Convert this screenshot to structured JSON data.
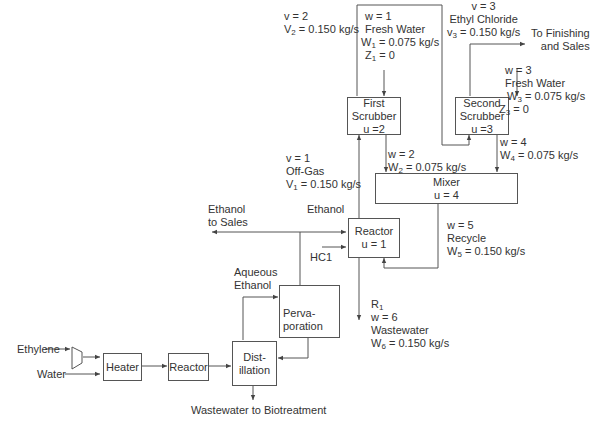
{
  "units": {
    "first_scrubber": {
      "l1": "First",
      "l2": "Scrubber",
      "l3": "u =2"
    },
    "second_scrubber": {
      "l1": "Second",
      "l2": "Scrubber",
      "l3": "u =3"
    },
    "mixer": {
      "l1": "Mixer",
      "l2": "u = 4"
    },
    "reactor1": {
      "l1": "Reactor",
      "l2": "u = 1"
    },
    "pervaporation": {
      "l1": "Perva-",
      "l2": "poration"
    },
    "distillation": {
      "l1": "Dist-",
      "l2": "illation"
    },
    "heater": {
      "l1": "Heater"
    },
    "reactor": {
      "l1": "Reactor"
    }
  },
  "streams": {
    "v2": {
      "id": "v = 2",
      "flow_sym": "V",
      "flow_sub": "2",
      "flow_val": " = 0.150 kg/s"
    },
    "w1": {
      "id": "w = 1",
      "name": "Fresh Water",
      "flow_sym": "W",
      "flow_sub": "1",
      "flow_val": " = 0.075 kg/s",
      "z_sym": "Z",
      "z_sub": "1",
      "z_val": " = 0"
    },
    "v3": {
      "id": "v = 3",
      "name": "Ethyl Chloride",
      "flow_sym": "v",
      "flow_sub": "3",
      "flow_val": " = 0.150 kg/s"
    },
    "finishing": {
      "l1": "To Finishing",
      "l2": "and Sales"
    },
    "w3": {
      "id": "w = 3",
      "name": "Fresh Water",
      "flow_sym": "W",
      "flow_sub": "3",
      "flow_val": " = 0.075 kg/s",
      "z_sym": "Z",
      "z_sub": "3",
      "z_val": " = 0"
    },
    "v1": {
      "id": "v = 1",
      "name": "Off-Gas",
      "flow_sym": "V",
      "flow_sub": "1",
      "flow_val": " = 0.150 kg/s"
    },
    "w2": {
      "id": "w = 2",
      "flow_sym": "W",
      "flow_sub": "2",
      "flow_val": " = 0.075 kg/s"
    },
    "w4": {
      "id": "w = 4",
      "flow_sym": "W",
      "flow_sub": "4",
      "flow_val": " = 0.075 kg/s"
    },
    "w5": {
      "id": "w = 5",
      "name": "Recycle",
      "flow_sym": "W",
      "flow_sub": "5",
      "flow_val": " = 0.150 kg/s"
    },
    "w6": {
      "r_sym": "R",
      "r_sub": "1",
      "id": "w = 6",
      "name": "Wastewater",
      "flow_sym": "W",
      "flow_sub": "6",
      "flow_val": " = 0.150 kg/s"
    },
    "ethanol_sales": {
      "l1": "Ethanol",
      "l2": "to Sales"
    },
    "ethanol": "Ethanol",
    "hcl": "HC1",
    "aqueous": {
      "l1": "Aqueous",
      "l2": "Ethanol"
    },
    "ethylene": "Ethylene",
    "water": "Water",
    "wastewater_bio": "Wastewater to Biotreatment"
  },
  "colors": {
    "line": "#555555",
    "text": "#333333"
  }
}
